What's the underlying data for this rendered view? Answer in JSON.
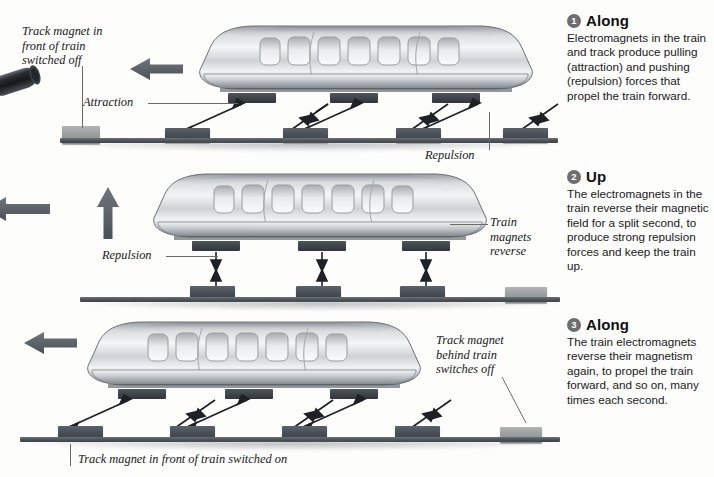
{
  "diagram": {
    "colors": {
      "magnet_on": "#4b5158",
      "magnet_off": "#9b9e9f",
      "rail": "#51565d",
      "badge": "#6e6e6e",
      "arrow": "#5b6069",
      "text": "#1a1a1a"
    }
  },
  "notes": [
    {
      "number": "1",
      "title": "Along",
      "body": "Electromagnets in the train and track produce pulling (attraction) and pushing (repulsion) forces that propel the train forward."
    },
    {
      "number": "2",
      "title": "Up",
      "body": "The electromagnets in the train reverse their magnetic field for a split second, to produce strong repulsion forces and keep the train up."
    },
    {
      "number": "3",
      "title": "Along",
      "body": "The train electromagnets reverse their magnetism again, to propel the train forward, and so on, many times each second."
    }
  ],
  "callouts": {
    "track_magnet_front_off": "Track magnet in\nfront of train\nswitched off",
    "attraction": "Attraction",
    "repulsion_1": "Repulsion",
    "repulsion_2": "Repulsion",
    "train_magnets_reverse": "Train\nmagnets\nreverse",
    "track_magnet_behind_off": "Track magnet\nbehind train\nswitches off",
    "track_magnet_front_on": "Track magnet in front of train switched on"
  },
  "panels": [
    {
      "id": "panel-along-1",
      "motion_arrow": "left",
      "train_magnets": [
        228,
        330,
        432
      ],
      "track_magnets": [
        {
          "x": 62,
          "state": "off"
        },
        {
          "x": 165,
          "state": "on"
        },
        {
          "x": 283,
          "state": "on"
        },
        {
          "x": 396,
          "state": "on"
        },
        {
          "x": 503,
          "state": "on"
        }
      ],
      "force_arrows": [
        "attraction",
        "repulsion",
        "attraction",
        "repulsion",
        "attraction",
        "repulsion"
      ]
    },
    {
      "id": "panel-up",
      "motion_arrow": "up",
      "train_magnets": [
        192,
        298,
        402
      ],
      "track_magnets": [
        {
          "x": 190,
          "state": "on"
        },
        {
          "x": 296,
          "state": "on"
        },
        {
          "x": 400,
          "state": "on"
        },
        {
          "x": 505,
          "state": "off"
        }
      ],
      "force_arrows": [
        "repulsion",
        "repulsion",
        "repulsion"
      ]
    },
    {
      "id": "panel-along-3",
      "motion_arrow": "left",
      "train_magnets": [
        118,
        225,
        330
      ],
      "track_magnets": [
        {
          "x": 58,
          "state": "on"
        },
        {
          "x": 170,
          "state": "on"
        },
        {
          "x": 282,
          "state": "on"
        },
        {
          "x": 395,
          "state": "on"
        },
        {
          "x": 500,
          "state": "off"
        }
      ],
      "force_arrows": [
        "attraction",
        "repulsion",
        "attraction",
        "repulsion",
        "attraction",
        "repulsion"
      ]
    }
  ],
  "train": {
    "window_count": 9,
    "description": "streamlined maglev carriage, side view"
  }
}
